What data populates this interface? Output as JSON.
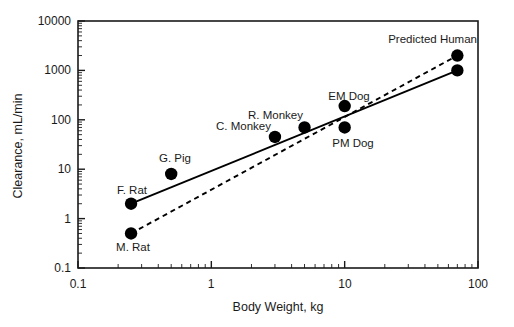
{
  "chart_data": {
    "type": "scatter",
    "title": "",
    "xlabel": "Body Weight, kg",
    "ylabel": "Clearance, mL/min",
    "xscale": "log",
    "yscale": "log",
    "xlim": [
      0.1,
      100
    ],
    "ylim": [
      0.1,
      10000
    ],
    "grid": false,
    "legend": "none",
    "x_ticks": [
      "0.1",
      "1",
      "10",
      "100"
    ],
    "x_tick_values": [
      0.1,
      1,
      10,
      100
    ],
    "y_ticks": [
      "0.1",
      "1",
      "10",
      "100",
      "1000",
      "10000"
    ],
    "y_tick_values": [
      0.1,
      1,
      10,
      100,
      1000,
      10000
    ],
    "points": [
      {
        "label": "M. Rat",
        "x": 0.25,
        "y": 0.5,
        "label_pos": "below"
      },
      {
        "label": "F. Rat",
        "x": 0.25,
        "y": 2.0,
        "label_pos": "above"
      },
      {
        "label": "G. Pig",
        "x": 0.5,
        "y": 8.0,
        "label_pos": "above"
      },
      {
        "label": "C. Monkey",
        "x": 3.0,
        "y": 45.0,
        "label_pos": "above-left"
      },
      {
        "label": "R. Monkey",
        "x": 5.0,
        "y": 70.0,
        "label_pos": "above-left"
      },
      {
        "label": "EM Dog",
        "x": 10.0,
        "y": 190.0,
        "label_pos": "above"
      },
      {
        "label": "PM Dog",
        "x": 10.0,
        "y": 70.0,
        "label_pos": "below"
      },
      {
        "label": "",
        "x": 70.0,
        "y": 2000.0,
        "label_pos": "none"
      },
      {
        "label": "",
        "x": 70.0,
        "y": 1000.0,
        "label_pos": "none"
      }
    ],
    "annotations": [
      {
        "text": "Predicted Human",
        "x": 40.0,
        "y": 5500.0
      }
    ],
    "series": [
      {
        "name": "solid-regression",
        "style": "solid",
        "x": [
          0.25,
          70.0
        ],
        "y": [
          2.0,
          1000.0
        ]
      },
      {
        "name": "dashed-regression",
        "style": "dashed",
        "x": [
          0.25,
          70.0
        ],
        "y": [
          0.5,
          2000.0
        ]
      }
    ]
  },
  "axes": {
    "x_title": "Body Weight, kg",
    "y_title": "Clearance, mL/min"
  },
  "labels": {
    "m_rat": "M. Rat",
    "f_rat": "F. Rat",
    "g_pig": "G. Pig",
    "c_monkey": "C. Monkey",
    "r_monkey": "R. Monkey",
    "em_dog": "EM Dog",
    "pm_dog": "PM Dog",
    "predicted_human": "Predicted Human"
  },
  "ticks": {
    "x": {
      "t0": "0.1",
      "t1": "1",
      "t2": "10",
      "t3": "100"
    },
    "y": {
      "t0": "0.1",
      "t1": "1",
      "t2": "10",
      "t3": "100",
      "t4": "1000",
      "t5": "10000"
    }
  },
  "colors": {
    "ink": "#000000",
    "axis": "#1a1a1a",
    "background": "#ffffff",
    "marker": "#000000"
  }
}
